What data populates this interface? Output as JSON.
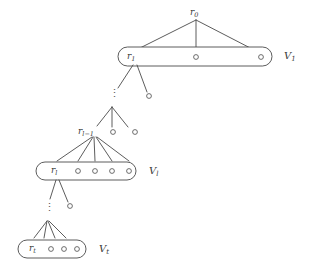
{
  "figure": {
    "type": "tree-diagram",
    "title": "",
    "background_color": "#ffffff",
    "stroke_color": "#4a4a4a",
    "text_color": "#3a3a3a",
    "node_fill": "#ffffff"
  },
  "nodes": {
    "root": {
      "base": "r",
      "sub": "0"
    },
    "level1_root": {
      "base": "r",
      "sub": "1"
    },
    "level_lm1_root": {
      "base": "r",
      "sub": "l−1"
    },
    "level_l_root": {
      "base": "r",
      "sub": "l"
    },
    "level_t_root": {
      "base": "r",
      "sub": "t"
    }
  },
  "group_labels": {
    "v1": {
      "base": "V",
      "sub": "1"
    },
    "vl": {
      "base": "V",
      "sub": "l"
    },
    "vt": {
      "base": "V",
      "sub": "t"
    }
  },
  "ellipsis": {
    "glyph": "⋮",
    "count": 2,
    "label": "vertical-ellipsis"
  },
  "structure": {
    "levels": [
      {
        "name": "V1",
        "root_label": "r1",
        "extra_circles": 2
      },
      {
        "name": "Vl-1-row",
        "root_label": "rl-1",
        "extra_circles": 2
      },
      {
        "name": "Vl",
        "root_label": "rl",
        "extra_circles": 4
      },
      {
        "name": "Vt",
        "root_label": "rt",
        "extra_circles": 3
      }
    ],
    "free_circles": 2
  }
}
